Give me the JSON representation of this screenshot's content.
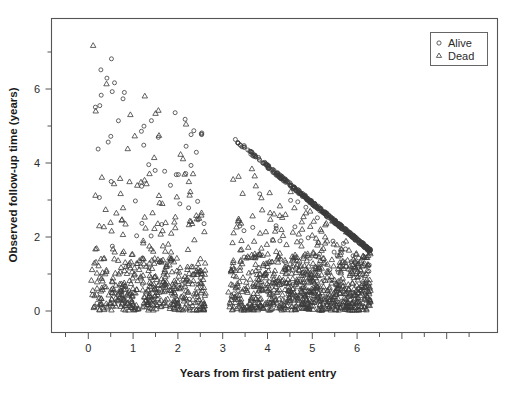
{
  "chart_data": {
    "type": "scatter",
    "title": "",
    "xlabel": "Years from first patient entry",
    "ylabel": "Observed follow-up time (years)",
    "xlim": [
      -0.55,
      6.85
    ],
    "ylim": [
      -0.75,
      7.6
    ],
    "xticks": [
      0,
      1,
      2,
      3,
      4,
      5,
      6
    ],
    "xticklabels": [
      "0",
      "1",
      "2",
      "3",
      "4",
      "5",
      "6"
    ],
    "yticks": [
      0,
      2,
      4,
      6
    ],
    "yticklabels": [
      "0",
      "2",
      "4",
      "6"
    ],
    "yminorticks": [
      1,
      3,
      5,
      7
    ],
    "xminorticks": [
      -0.5,
      0.5,
      1.5,
      2.5,
      3.5,
      4.5,
      5.5,
      6.5
    ],
    "grid": false,
    "legend_position": "top-right",
    "marker_color": "#3b3b3b",
    "frame_color": "#555555",
    "series": [
      {
        "name": "Alive",
        "marker": "circle",
        "note": "Administratively censored patients; right-hand group lies on a dense descending band from (3.15, 4.9) to (6.3, 1.65); left-hand group scattered from (0.1,0.1) to (2.6,7.1)."
      },
      {
        "name": "Dead",
        "marker": "triangle",
        "note": "Observed deaths; scattered below the censoring boundary in both accrual clusters."
      }
    ],
    "annotations": [
      "Accrual gap with no entries between about 2.65 and 3.1 years.",
      "Dense diagonal band of Alive circles marks administrative censoring at study close (~6.3 + 1.65 = 7.95 years)."
    ]
  },
  "legend": {
    "entries": [
      {
        "label": "Alive",
        "marker": "circle"
      },
      {
        "label": "Dead",
        "marker": "triangle"
      }
    ]
  },
  "axes": {
    "x_title": "Years from first patient entry",
    "y_title": "Observed follow-up time (years)",
    "x_tick_labels": [
      "0",
      "1",
      "2",
      "3",
      "4",
      "5",
      "6"
    ],
    "y_tick_labels": [
      "0",
      "2",
      "4",
      "6"
    ]
  }
}
